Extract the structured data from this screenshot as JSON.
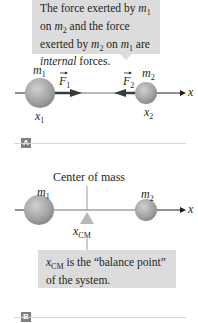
{
  "panel_a": {
    "tag": "A",
    "callout": {
      "line1_pre": "The force exerted by ",
      "line1_var": "m",
      "line1_sub": "1",
      "line2_pre": "on ",
      "line2_var": "m",
      "line2_sub": "2",
      "line2_post": " and the force",
      "line3_pre": "exerted by ",
      "line3_var1": "m",
      "line3_sub1": "2",
      "line3_mid": " on ",
      "line3_var2": "m",
      "line3_sub2": "1",
      "line3_post": " are",
      "line4_em": "internal",
      "line4_post": " forces."
    },
    "mass1": {
      "var": "m",
      "sub": "1"
    },
    "mass2": {
      "var": "m",
      "sub": "2"
    },
    "force1": {
      "var": "F",
      "sub": "1"
    },
    "force2": {
      "var": "F",
      "sub": "2"
    },
    "pos1": {
      "var": "x",
      "sub": "1"
    },
    "pos2": {
      "var": "x",
      "sub": "2"
    },
    "axis_label": "x"
  },
  "panel_b": {
    "tag": "B",
    "center_label": "Center of mass",
    "mass1": {
      "var": "m",
      "sub": "1"
    },
    "mass2": {
      "var": "m",
      "sub": "2"
    },
    "cm_label": {
      "var": "x",
      "sub": "CM"
    },
    "axis_label": "x",
    "callout": {
      "var": "x",
      "sub": "CM",
      "line1_post": " is the “balance point”",
      "line2": "of the system."
    }
  },
  "colors": {
    "sphere": "#a8a8a8",
    "callout_bg": "#dcdcdc",
    "arrow": "#3a3a3a",
    "axis": "#231f20",
    "rod": "#b8b8b8"
  }
}
